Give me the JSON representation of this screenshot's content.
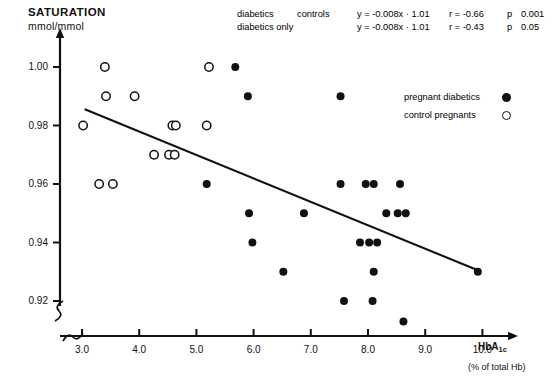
{
  "chart_data": {
    "type": "scatter",
    "title": "SATURATION",
    "ylabel": "mmol/mmol",
    "xlabel": "HbA1c",
    "xlabel_sub": "(% of total Hb)",
    "xlim": [
      2.6,
      10.45
    ],
    "ylim": [
      0.911,
      1.006
    ],
    "grid": false,
    "axis_break_x": true,
    "axis_break_y": true,
    "yticks": [
      "1.00",
      "0.98",
      "0.96",
      "0.94",
      "0.92"
    ],
    "ytick_values": [
      1.0,
      0.98,
      0.96,
      0.94,
      0.92
    ],
    "xticks": [
      "3.0",
      "4.0",
      "5.0",
      "6.0",
      "7.0",
      "8.0",
      "9.0",
      "10.0"
    ],
    "xtick_values": [
      3.0,
      4.0,
      5.0,
      6.0,
      7.0,
      8.0,
      9.0,
      10.0
    ],
    "legend_position": "upper right",
    "series": [
      {
        "name": "pregnant diabetics",
        "marker": "filled-circle",
        "color": "#111111",
        "points": [
          [
            5.68,
            1.0
          ],
          [
            5.9,
            0.99
          ],
          [
            7.52,
            0.99
          ],
          [
            5.18,
            0.96
          ],
          [
            7.52,
            0.96
          ],
          [
            7.96,
            0.96
          ],
          [
            8.1,
            0.96
          ],
          [
            8.56,
            0.96
          ],
          [
            5.92,
            0.95
          ],
          [
            6.88,
            0.95
          ],
          [
            8.32,
            0.95
          ],
          [
            8.52,
            0.95
          ],
          [
            8.66,
            0.95
          ],
          [
            5.98,
            0.94
          ],
          [
            7.86,
            0.94
          ],
          [
            8.02,
            0.94
          ],
          [
            8.16,
            0.94
          ],
          [
            6.52,
            0.93
          ],
          [
            8.1,
            0.93
          ],
          [
            9.92,
            0.93
          ],
          [
            7.58,
            0.92
          ],
          [
            8.08,
            0.92
          ],
          [
            8.62,
            0.913
          ]
        ]
      },
      {
        "name": "control pregnants",
        "marker": "open-circle",
        "color": "#111111",
        "points": [
          [
            3.4,
            1.0
          ],
          [
            5.22,
            1.0
          ],
          [
            3.42,
            0.99
          ],
          [
            3.92,
            0.99
          ],
          [
            3.02,
            0.98
          ],
          [
            4.58,
            0.98
          ],
          [
            4.64,
            0.98
          ],
          [
            5.18,
            0.98
          ],
          [
            4.26,
            0.97
          ],
          [
            4.52,
            0.97
          ],
          [
            4.62,
            0.97
          ],
          [
            3.3,
            0.96
          ],
          [
            3.54,
            0.96
          ]
        ]
      }
    ],
    "regression_line": {
      "x_start": 3.06,
      "y_start": 0.9855,
      "x_end": 9.92,
      "y_end": 0.9305
    },
    "stats": {
      "headers": [
        "group",
        "equation",
        "correlation",
        "p_label",
        "p_value"
      ],
      "rows": [
        {
          "group_a": "diabetics",
          "group_b": "controls",
          "equation": "y = -0.008x · 1.01",
          "correlation": "r = -0.66",
          "p_label": "p",
          "p_value": "0.001"
        },
        {
          "group_a": "diabetics only",
          "group_b": "",
          "equation": "y = -0.008x · 1.01",
          "correlation": "r = -0.43",
          "p_label": "p",
          "p_value": "0.05"
        }
      ]
    }
  }
}
